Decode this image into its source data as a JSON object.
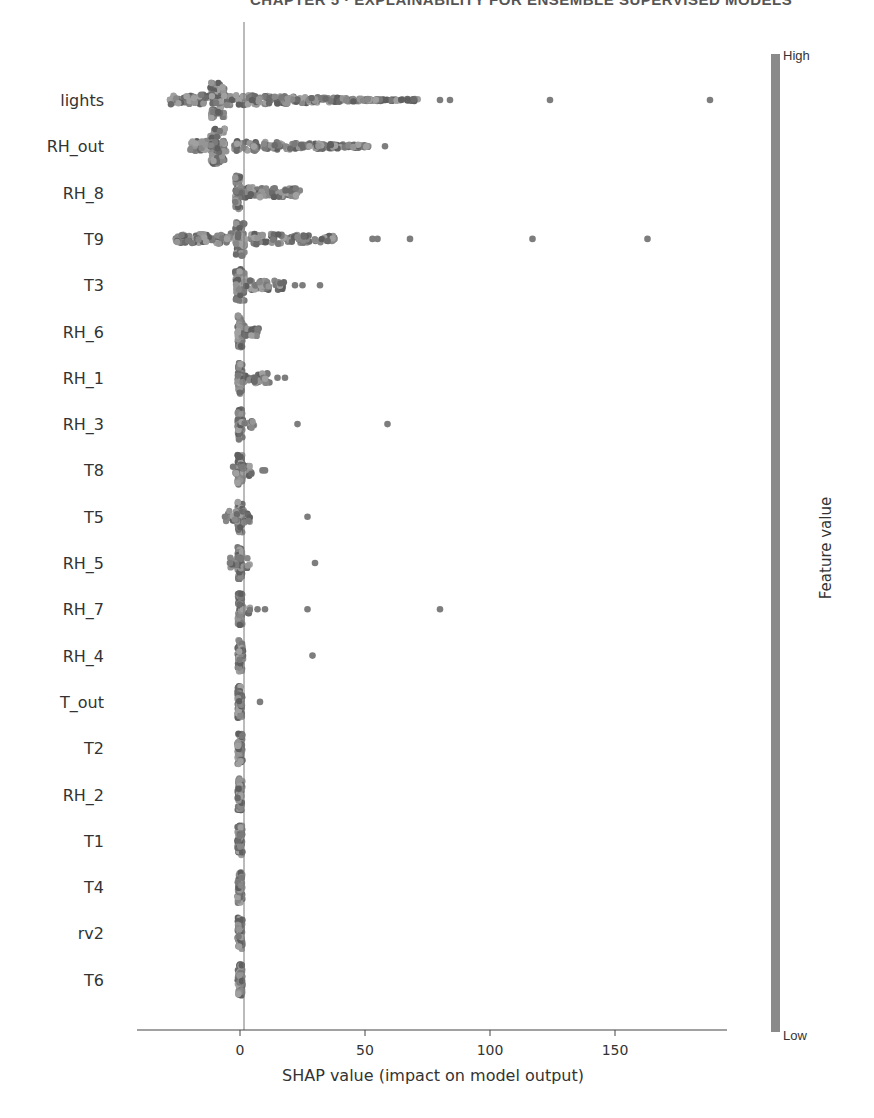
{
  "page": {
    "header_text": "CHAPTER 5 · EXPLAINABILITY FOR ENSEMBLE SUPERVISED MODELS"
  },
  "chart_data": {
    "type": "scatter",
    "subtype": "shap_beeswarm_summary",
    "title": "",
    "xlabel": "SHAP value (impact on model output)",
    "ylabel": "",
    "xlim": [
      -40,
      196
    ],
    "xticks": [
      0,
      50,
      100,
      150
    ],
    "xtick_labels": [
      "0",
      "50",
      "100",
      "150"
    ],
    "grid": false,
    "colorbar": {
      "title": "Feature value",
      "high_label": "High",
      "low_label": "Low",
      "color": "#8a8a8a"
    },
    "features": [
      {
        "name": "lights",
        "min": -28,
        "max": 188,
        "core": [
          -12,
          -6
        ],
        "spread_to": 72,
        "outliers": [
          80,
          84,
          124,
          188
        ]
      },
      {
        "name": "RH_out",
        "min": -20,
        "max": 58,
        "core": [
          -12,
          -6
        ],
        "spread_to": 52,
        "outliers": [
          58
        ]
      },
      {
        "name": "RH_8",
        "min": -2,
        "max": 24,
        "core": [
          -2,
          0
        ],
        "spread_to": 24,
        "outliers": []
      },
      {
        "name": "T9",
        "min": -26,
        "max": 163,
        "core": [
          -2,
          2
        ],
        "spread_to": 38,
        "outliers": [
          53,
          55,
          68,
          117,
          163
        ]
      },
      {
        "name": "T3",
        "min": -2,
        "max": 32,
        "core": [
          -2,
          2
        ],
        "spread_to": 18,
        "outliers": [
          22,
          25,
          32
        ]
      },
      {
        "name": "RH_6",
        "min": -1,
        "max": 8,
        "core": [
          -1,
          1
        ],
        "spread_to": 8,
        "outliers": []
      },
      {
        "name": "RH_1",
        "min": -1,
        "max": 18,
        "core": [
          -1,
          1
        ],
        "spread_to": 12,
        "outliers": [
          15,
          18
        ]
      },
      {
        "name": "RH_3",
        "min": -1,
        "max": 59,
        "core": [
          -1,
          1
        ],
        "spread_to": 6,
        "outliers": [
          23,
          59
        ]
      },
      {
        "name": "T8",
        "min": -3,
        "max": 10,
        "core": [
          -1,
          1
        ],
        "spread_to": 5,
        "outliers": [
          9,
          10
        ]
      },
      {
        "name": "T5",
        "min": -6,
        "max": 27,
        "core": [
          -1,
          1
        ],
        "spread_to": 4,
        "outliers": [
          -6,
          27
        ]
      },
      {
        "name": "RH_5",
        "min": -4,
        "max": 30,
        "core": [
          -1,
          1
        ],
        "spread_to": 4,
        "outliers": [
          -4,
          30
        ]
      },
      {
        "name": "RH_7",
        "min": -1,
        "max": 80,
        "core": [
          -1,
          1
        ],
        "spread_to": 4,
        "outliers": [
          7,
          10,
          27,
          80
        ]
      },
      {
        "name": "RH_4",
        "min": -1,
        "max": 29,
        "core": [
          -1,
          1
        ],
        "spread_to": 3,
        "outliers": [
          29
        ]
      },
      {
        "name": "T_out",
        "min": -1,
        "max": 8,
        "core": [
          -1,
          1
        ],
        "spread_to": 1,
        "outliers": [
          8
        ]
      },
      {
        "name": "T2",
        "min": -1,
        "max": 1,
        "core": [
          -1,
          1
        ],
        "spread_to": 1,
        "outliers": []
      },
      {
        "name": "RH_2",
        "min": -1,
        "max": 1,
        "core": [
          -1,
          1
        ],
        "spread_to": 1,
        "outliers": []
      },
      {
        "name": "T1",
        "min": -1,
        "max": 1,
        "core": [
          -1,
          1
        ],
        "spread_to": 1,
        "outliers": []
      },
      {
        "name": "T4",
        "min": -1,
        "max": 1,
        "core": [
          -1,
          1
        ],
        "spread_to": 1,
        "outliers": []
      },
      {
        "name": "rv2",
        "min": -1,
        "max": 1,
        "core": [
          -1,
          1
        ],
        "spread_to": 1,
        "outliers": []
      },
      {
        "name": "T6",
        "min": -1,
        "max": 1,
        "core": [
          -1,
          1
        ],
        "spread_to": 1,
        "outliers": []
      }
    ]
  }
}
